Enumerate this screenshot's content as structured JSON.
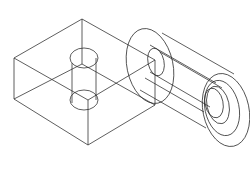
{
  "diagram": {
    "type": "isometric wireframe",
    "stroke_color": "#2a2a2a",
    "background": "#ffffff",
    "parts": [
      {
        "name": "rectangular block with vertical through-hole"
      },
      {
        "name": "flanged cylindrical sleeve with stepped bore"
      }
    ]
  }
}
